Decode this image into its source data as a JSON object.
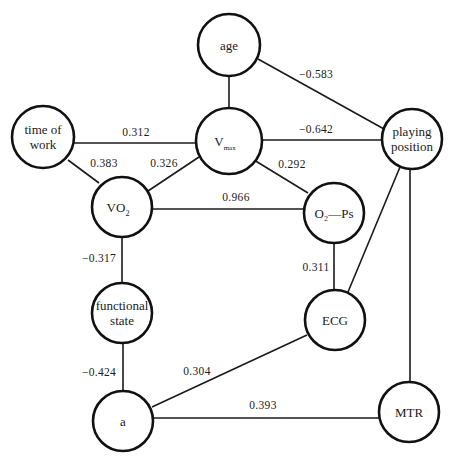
{
  "diagram": {
    "type": "correlation-graph",
    "nodes": [
      {
        "id": "age",
        "lines": [
          "age"
        ],
        "cx": 229,
        "cy": 45,
        "r": 31
      },
      {
        "id": "vmax",
        "lines": [
          "V"
        ],
        "sub": "max",
        "cx": 229,
        "cy": 141,
        "r": 33
      },
      {
        "id": "time_of_work",
        "lines": [
          "time of",
          "work"
        ],
        "cx": 43,
        "cy": 137,
        "r": 31
      },
      {
        "id": "vo2",
        "lines": [
          "VO"
        ],
        "sub": "2",
        "cx": 122,
        "cy": 207,
        "r": 30
      },
      {
        "id": "o2_ps",
        "lines": [
          "O₂—Ps"
        ],
        "cx": 334,
        "cy": 213,
        "r": 30
      },
      {
        "id": "playing_position",
        "lines": [
          "playing",
          "position"
        ],
        "cx": 412,
        "cy": 139,
        "r": 30
      },
      {
        "id": "functional_state",
        "lines": [
          "functional",
          "state"
        ],
        "cx": 122,
        "cy": 313,
        "r": 30
      },
      {
        "id": "ecg",
        "lines": [
          "ECG"
        ],
        "cx": 335,
        "cy": 320,
        "r": 30
      },
      {
        "id": "a",
        "lines": [
          "a"
        ],
        "cx": 123,
        "cy": 421,
        "r": 30
      },
      {
        "id": "mtr",
        "lines": [
          "MTR"
        ],
        "cx": 409,
        "cy": 412,
        "r": 30
      }
    ],
    "edges": [
      {
        "from": "age",
        "to": "vmax",
        "label": "",
        "x1": 229,
        "y1": 76,
        "x2": 229,
        "y2": 108
      },
      {
        "from": "age",
        "to": "playing_position",
        "label": "−0.583",
        "x1": 258,
        "y1": 59,
        "x2": 384,
        "y2": 129,
        "lx": 316,
        "ly": 78
      },
      {
        "from": "time_of_work",
        "to": "vmax",
        "label": "0.312",
        "x1": 74,
        "y1": 143,
        "x2": 196,
        "y2": 143,
        "lx": 136,
        "ly": 136
      },
      {
        "from": "vmax",
        "to": "playing_position",
        "label": "−0.642",
        "x1": 262,
        "y1": 140,
        "x2": 382,
        "y2": 140,
        "lx": 316,
        "ly": 133
      },
      {
        "from": "time_of_work",
        "to": "vo2",
        "label": "0.383",
        "x1": 68,
        "y1": 160,
        "x2": 99,
        "y2": 183,
        "lx": 104,
        "ly": 167
      },
      {
        "from": "vo2",
        "to": "vmax",
        "label": "0.326",
        "x1": 148,
        "y1": 191,
        "x2": 199,
        "y2": 157,
        "lx": 164,
        "ly": 167
      },
      {
        "from": "vmax",
        "to": "o2_ps",
        "label": "0.292",
        "x1": 254,
        "y1": 160,
        "x2": 308,
        "y2": 193,
        "lx": 292,
        "ly": 168
      },
      {
        "from": "vo2",
        "to": "o2_ps",
        "label": "0.966",
        "x1": 152,
        "y1": 209,
        "x2": 304,
        "y2": 209,
        "lx": 236,
        "ly": 201
      },
      {
        "from": "vo2",
        "to": "functional_state",
        "label": "−0.317",
        "x1": 122,
        "y1": 237,
        "x2": 122,
        "y2": 283,
        "lx": 99,
        "ly": 262
      },
      {
        "from": "o2_ps",
        "to": "ecg",
        "label": "0.311",
        "x1": 334,
        "y1": 243,
        "x2": 334,
        "y2": 290,
        "lx": 316,
        "ly": 271
      },
      {
        "from": "ecg",
        "to": "playing_position",
        "label": "",
        "x1": 348,
        "y1": 292,
        "x2": 400,
        "y2": 167
      },
      {
        "from": "playing_position",
        "to": "mtr",
        "label": "",
        "x1": 410,
        "y1": 169,
        "x2": 410,
        "y2": 382
      },
      {
        "from": "functional_state",
        "to": "a",
        "label": "−0.424",
        "x1": 123,
        "y1": 343,
        "x2": 123,
        "y2": 391,
        "lx": 99,
        "ly": 376
      },
      {
        "from": "a",
        "to": "ecg",
        "label": "0.304",
        "x1": 152,
        "y1": 407,
        "x2": 307,
        "y2": 335,
        "lx": 197,
        "ly": 375
      },
      {
        "from": "a",
        "to": "mtr",
        "label": "0.393",
        "x1": 154,
        "y1": 418,
        "x2": 379,
        "y2": 418,
        "lx": 263,
        "ly": 409
      }
    ]
  }
}
